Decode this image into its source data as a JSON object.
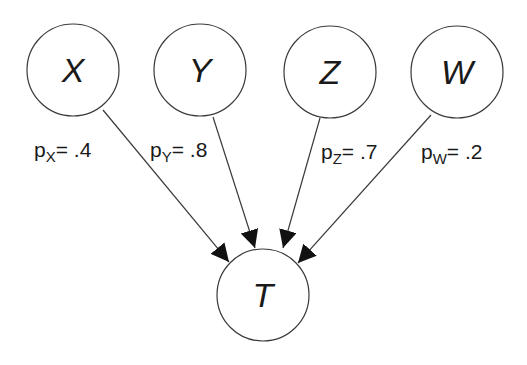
{
  "diagram": {
    "nodes": [
      {
        "id": "X",
        "label": "X"
      },
      {
        "id": "Y",
        "label": "Y"
      },
      {
        "id": "Z",
        "label": "Z"
      },
      {
        "id": "W",
        "label": "W"
      },
      {
        "id": "T",
        "label": "T"
      }
    ],
    "edges": [
      {
        "from": "X",
        "to": "T",
        "prob_symbol": "p",
        "prob_sub": "X",
        "prob_text": "= .4"
      },
      {
        "from": "Y",
        "to": "T",
        "prob_symbol": "p",
        "prob_sub": "Y",
        "prob_text": "= .8"
      },
      {
        "from": "Z",
        "to": "T",
        "prob_symbol": "p",
        "prob_sub": "Z",
        "prob_text": "= .7"
      },
      {
        "from": "W",
        "to": "T",
        "prob_symbol": "p",
        "prob_sub": "W",
        "prob_text": "= .2"
      }
    ],
    "colors": {
      "stroke": "#3a3a3a",
      "text": "#1a1a1a",
      "background": "#ffffff"
    }
  }
}
